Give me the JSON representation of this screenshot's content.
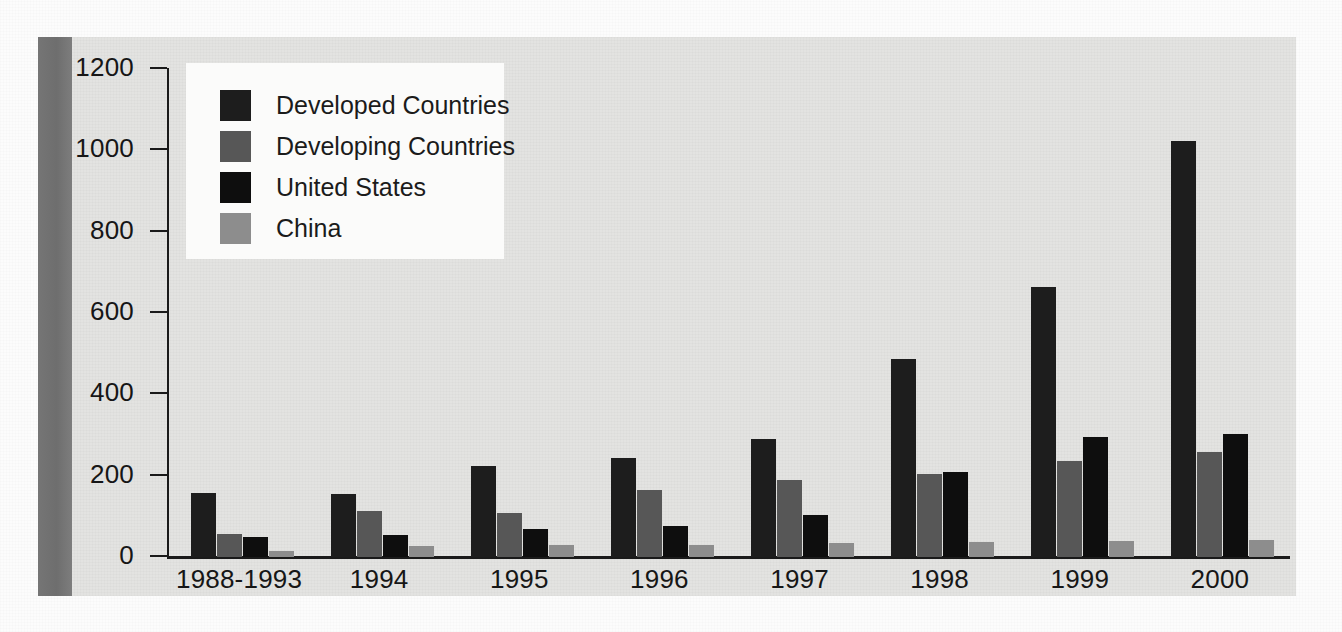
{
  "chart_data": {
    "type": "bar",
    "title": "",
    "subtitle": "",
    "xlabel": "",
    "ylabel": "",
    "ylim": [
      0,
      1200
    ],
    "yticks": [
      0,
      200,
      400,
      600,
      800,
      1000,
      1200
    ],
    "ytick_labels": [
      "0",
      "200",
      "400",
      "600",
      "800",
      "1000",
      "1200"
    ],
    "grid": false,
    "legend_position": "top-left",
    "categories": [
      "1988-1993",
      "1994",
      "1995",
      "1996",
      "1997",
      "1998",
      "1999",
      "2000"
    ],
    "series": [
      {
        "name": "Developed Countries",
        "color": "#1d1d1d",
        "values": [
          158,
          156,
          224,
          243,
          291,
          487,
          663,
          1022
        ]
      },
      {
        "name": "Developing Countries",
        "color": "#575757",
        "values": [
          57,
          113,
          108,
          164,
          190,
          203,
          235,
          259
        ]
      },
      {
        "name": "United States",
        "color": "#0e0e0e",
        "values": [
          48,
          53,
          68,
          77,
          104,
          209,
          295,
          303
        ]
      },
      {
        "name": "China",
        "color": "#8d8d8d",
        "values": [
          14,
          28,
          30,
          30,
          34,
          36,
          39,
          41
        ]
      }
    ]
  },
  "legend": {
    "items": [
      {
        "label": "Developed Countries",
        "color": "#1d1d1d"
      },
      {
        "label": "Developing Countries",
        "color": "#575757"
      },
      {
        "label": "United States",
        "color": "#0e0e0e"
      },
      {
        "label": "China",
        "color": "#8d8d8d"
      }
    ]
  },
  "colors": {
    "plate_background": "#e3e3e1",
    "page_background": "#fcfcfc",
    "axis": "#1a1a1a",
    "gutter": "#6e6e6e",
    "legend_background": "#fbfbfa",
    "text": "#161616"
  }
}
